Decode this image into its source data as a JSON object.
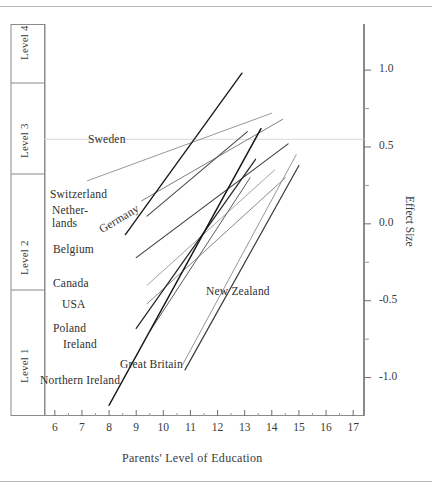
{
  "figure": {
    "bg": "#ffffff",
    "frame_color": "#7d7d7d",
    "rule_color": "#b9b9b9"
  },
  "axes": {
    "x": {
      "title": "Parents' Level of Education",
      "ticks": [
        6,
        7,
        8,
        9,
        10,
        11,
        12,
        13,
        14,
        15,
        16,
        17
      ],
      "min": 5.6,
      "max": 17.4
    },
    "y_right": {
      "title": "Effect Size",
      "ticks": [
        "1.0",
        "0.5",
        "0.0",
        "-0.5",
        "-1.0"
      ],
      "tick_values": [
        1.0,
        0.5,
        0.0,
        -0.5,
        -1.0
      ],
      "min": -1.25,
      "max": 1.3
    },
    "y_left": {
      "bands": [
        {
          "label": "Level 4",
          "top": 0.98,
          "bottom": 0.62
        },
        {
          "label": "Level 3",
          "top": 0.62,
          "bottom": 0.12
        },
        {
          "label": "Level 2",
          "top": 0.12,
          "bottom": -0.52
        },
        {
          "label": "Level 1",
          "top": -0.52,
          "bottom": -1.22
        }
      ]
    },
    "gridline_y": 0.55
  },
  "chart_data": {
    "type": "line",
    "title": "",
    "xlabel": "Parents' Level of Education",
    "ylabel": "Effect Size",
    "xlim": [
      5.6,
      17.4
    ],
    "ylim": [
      -1.25,
      1.3
    ],
    "grid": false,
    "legend": "inline-labels",
    "series": [
      {
        "name": "Sweden",
        "x": [
          7.2,
          14.0
        ],
        "y": [
          0.28,
          0.72
        ],
        "color": "#8d8d8d",
        "width": 0.9
      },
      {
        "name": "Switzerland",
        "x": [
          9.2,
          14.4
        ],
        "y": [
          0.15,
          0.68
        ],
        "color": "#6f6f6f",
        "width": 0.9
      },
      {
        "name": "Netherlands",
        "x": [
          9.4,
          13.1
        ],
        "y": [
          0.05,
          0.6
        ],
        "color": "#4a4a4a",
        "width": 1.1
      },
      {
        "name": "Germany",
        "x": [
          8.6,
          12.9
        ],
        "y": [
          -0.07,
          0.98
        ],
        "color": "#1e1e1e",
        "width": 1.4
      },
      {
        "name": "Belgium",
        "x": [
          9.0,
          14.6
        ],
        "y": [
          -0.22,
          0.52
        ],
        "color": "#3c3c3c",
        "width": 1.1
      },
      {
        "name": "Canada",
        "x": [
          9.4,
          14.1
        ],
        "y": [
          -0.4,
          0.35
        ],
        "color": "#9a9a9a",
        "width": 0.9
      },
      {
        "name": "USA",
        "x": [
          9.4,
          14.5
        ],
        "y": [
          -0.52,
          0.3
        ],
        "color": "#7a7a7a",
        "width": 0.9
      },
      {
        "name": "Poland",
        "x": [
          9.0,
          13.4
        ],
        "y": [
          -0.68,
          0.42
        ],
        "color": "#2b2b2b",
        "width": 1.3
      },
      {
        "name": "Ireland",
        "x": [
          9.5,
          13.2
        ],
        "y": [
          -0.7,
          0.3
        ],
        "color": "#5a5a5a",
        "width": 1.0
      },
      {
        "name": "Great Britain",
        "x": [
          10.7,
          14.9
        ],
        "y": [
          -0.92,
          0.45
        ],
        "color": "#8a8a8a",
        "width": 0.9
      },
      {
        "name": "Northern Ireland",
        "x": [
          8.0,
          13.6
        ],
        "y": [
          -1.18,
          0.62
        ],
        "color": "#151515",
        "width": 1.5
      },
      {
        "name": "New Zealand",
        "x": [
          10.8,
          15.0
        ],
        "y": [
          -0.95,
          0.38
        ],
        "color": "#3a3a3a",
        "width": 1.2
      }
    ]
  },
  "labels": {
    "sweden": "Sweden",
    "switzerland": "Switzerland",
    "netherlands_l1": "Nether-",
    "netherlands_l2": "lands",
    "germany": "Germany",
    "belgium": "Belgium",
    "canada": "Canada",
    "usa": "USA",
    "poland": "Poland",
    "ireland": "Ireland",
    "great_britain": "Great Britain",
    "northern_ireland": "Northern Ireland",
    "new_zealand": "New Zealand"
  }
}
